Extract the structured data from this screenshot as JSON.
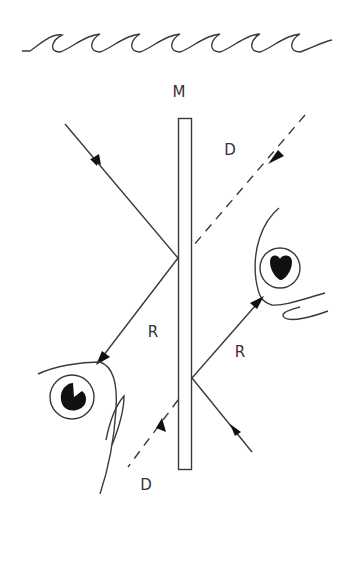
{
  "diagram": {
    "labels": {
      "mirror": "M",
      "direct_top": "D",
      "direct_bottom": "D",
      "reflected_left": "R",
      "reflected_right": "R"
    },
    "colors": {
      "line": "#3a3a3a",
      "background": "#ffffff",
      "arrow": "#111111"
    },
    "elements": {
      "water_surface": "wavy line",
      "mirror": "vertical rectangle",
      "fish_left": "fish head facing right, lower left",
      "fish_right": "fish head facing left, upper right",
      "rays": [
        {
          "type": "reflected",
          "from": "fish_right",
          "via": "mirror left face top",
          "to": "fish_left",
          "label": "R"
        },
        {
          "type": "reflected",
          "from": "fish_left",
          "via": "mirror right face bottom",
          "to": "fish_right",
          "label": "R"
        },
        {
          "type": "direct",
          "style": "dashed",
          "label": "D"
        }
      ]
    }
  }
}
